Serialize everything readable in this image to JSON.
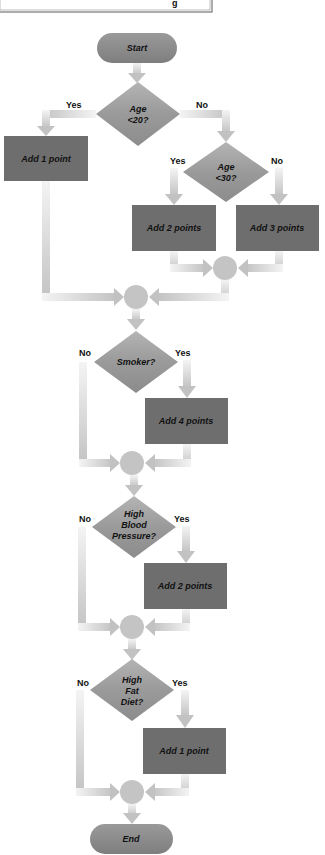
{
  "header_box": {
    "glyph": "g"
  },
  "terminals": {
    "start": "Start",
    "end": "End"
  },
  "decisions": [
    {
      "id": "age20",
      "lines": [
        "Age",
        "<20?"
      ],
      "yes": "Yes",
      "no": "No"
    },
    {
      "id": "age30",
      "lines": [
        "Age",
        "<30?"
      ],
      "yes": "Yes",
      "no": "No"
    },
    {
      "id": "smoker",
      "lines": [
        "Smoker?"
      ],
      "yes": "Yes",
      "no": "No"
    },
    {
      "id": "bp",
      "lines": [
        "High",
        "Blood",
        "Pressure?"
      ],
      "yes": "Yes",
      "no": "No"
    },
    {
      "id": "fat",
      "lines": [
        "High",
        "Fat",
        "Diet?"
      ],
      "yes": "Yes",
      "no": "No"
    }
  ],
  "processes": [
    {
      "id": "p1",
      "label": "Add 1 point"
    },
    {
      "id": "p2",
      "label": "Add 2 points"
    },
    {
      "id": "p3",
      "label": "Add 3 points"
    },
    {
      "id": "p4",
      "label": "Add 4 points"
    },
    {
      "id": "p5",
      "label": "Add 2 points"
    },
    {
      "id": "p6",
      "label": "Add 1 point"
    }
  ],
  "colors": {
    "terminal": "#8a8a8a",
    "decision": "#9c9c9c",
    "process": "#6e6e6e",
    "connector": "#c4c4c4",
    "arrow": "#c8c8c8",
    "text": "#111111"
  }
}
